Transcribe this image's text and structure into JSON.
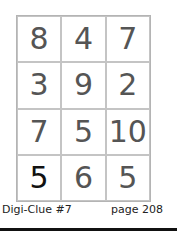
{
  "puzzle": {
    "grid": [
      [
        "8",
        "4",
        "7"
      ],
      [
        "3",
        "9",
        "2"
      ],
      [
        "7",
        "5",
        "10"
      ],
      [
        "5",
        "6",
        "5"
      ]
    ]
  },
  "caption": {
    "title": "Digi-Clue #7",
    "page": "page 208"
  }
}
